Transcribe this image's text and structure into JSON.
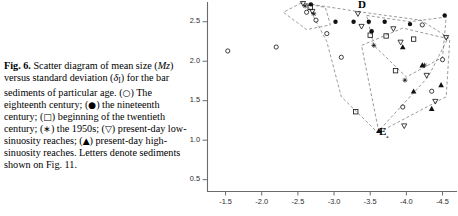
{
  "figure": {
    "label": "Fig. 6.",
    "caption_segments": [
      {
        "t": "Scatter diagram of mean size ("
      },
      {
        "t": "Mz",
        "style": "italic"
      },
      {
        "t": ") versus standard deviation ("
      },
      {
        "t": "δ",
        "style": "italic"
      },
      {
        "t": "I",
        "style": "sub"
      },
      {
        "t": ") for the bar sediments of particular age. ("
      },
      {
        "t": "○",
        "style": "glyph"
      },
      {
        "t": ") The eighteenth century; ("
      },
      {
        "t": "●",
        "style": "glyph"
      },
      {
        "t": ") the nineteenth century; ("
      },
      {
        "t": "□",
        "style": "glyph"
      },
      {
        "t": ") beginning of the twentieth century; ("
      },
      {
        "t": "∗",
        "style": "glyph"
      },
      {
        "t": ") the 1950s; ("
      },
      {
        "t": "▽",
        "style": "glyph"
      },
      {
        "t": ") present-day low-sinuosity reaches; ("
      },
      {
        "t": "▲",
        "style": "glyph"
      },
      {
        "t": ") present-day high-sinuosity reaches. Letters denote sediments shown on Fig. 11."
      }
    ],
    "caption_plain": "Fig. 6. Scatter diagram of mean size (Mz) versus standard deviation (δI) for the bar sediments of particular age. (○) The eighteenth century; (●) the nineteenth century; (□) beginning of the twentieth century; (∗) the 1950s; (▽) present-day low-sinuosity reaches; (▲) present-day high-sinuosity reaches. Letters denote sediments shown on Fig. 11."
  },
  "legend_keys": [
    {
      "symbol": "○",
      "name": "open-circle",
      "label": "The eighteenth century"
    },
    {
      "symbol": "●",
      "name": "filled-circle",
      "label": "the nineteenth century"
    },
    {
      "symbol": "□",
      "name": "open-square",
      "label": "beginning of the twentieth century"
    },
    {
      "symbol": "∗",
      "name": "asterisk",
      "label": "the 1950s"
    },
    {
      "symbol": "▽",
      "name": "open-triangle-down",
      "label": "present-day low-sinuosity reaches"
    },
    {
      "symbol": "▲",
      "name": "filled-triangle-up",
      "label": "present-day high-sinuosity reaches"
    }
  ],
  "chart_data": {
    "type": "scatter",
    "title": "",
    "xlabel": "",
    "ylabel": "",
    "xlim": [
      -1.25,
      -4.7
    ],
    "ylim": [
      0.35,
      2.75
    ],
    "x_reversed": true,
    "grid": false,
    "legend_position": "none",
    "xticks": [
      -1.5,
      -2.0,
      -2.5,
      -3.0,
      -3.5,
      -4.0,
      -4.5
    ],
    "xticklabels": [
      "-1.5",
      "-2.0",
      "-2.5",
      "-3.0",
      "-3.5",
      "-4.0",
      "-4.5"
    ],
    "yticks": [
      0.5,
      1.0,
      1.5,
      2.0,
      2.5
    ],
    "yticklabels": [
      "0.5",
      "1.0",
      "1.5",
      "2.0",
      "2.5"
    ],
    "annotations": [
      {
        "text": "D",
        "x": -3.33,
        "y": 2.72,
        "bold": true
      },
      {
        "text": "E₂",
        "x": -3.62,
        "y": 1.12,
        "bold": true
      }
    ],
    "series": [
      {
        "name": "The eighteenth century",
        "marker": "open-circle",
        "points": [
          {
            "x": -1.53,
            "y": 2.13
          },
          {
            "x": -2.2,
            "y": 2.18
          },
          {
            "x": -2.62,
            "y": 2.62
          },
          {
            "x": -2.75,
            "y": 2.52
          },
          {
            "x": -2.9,
            "y": 2.35
          },
          {
            "x": -3.1,
            "y": 2.05
          },
          {
            "x": -4.22,
            "y": 2.46
          },
          {
            "x": -4.5,
            "y": 2.02
          },
          {
            "x": -4.35,
            "y": 1.62
          },
          {
            "x": -3.95,
            "y": 1.42
          }
        ]
      },
      {
        "name": "the nineteenth century",
        "marker": "filled-circle",
        "points": [
          {
            "x": -2.68,
            "y": 2.72
          },
          {
            "x": -3.02,
            "y": 2.5
          },
          {
            "x": -3.27,
            "y": 2.5
          },
          {
            "x": -3.48,
            "y": 2.5
          },
          {
            "x": -3.7,
            "y": 2.5
          },
          {
            "x": -4.05,
            "y": 2.47
          },
          {
            "x": -4.53,
            "y": 2.58
          },
          {
            "x": -3.52,
            "y": 2.38
          }
        ]
      },
      {
        "name": "beginning of the twentieth century",
        "marker": "open-square",
        "points": [
          {
            "x": -2.67,
            "y": 2.68
          },
          {
            "x": -3.5,
            "y": 2.33
          },
          {
            "x": -3.72,
            "y": 2.32
          },
          {
            "x": -3.85,
            "y": 1.88
          },
          {
            "x": -4.1,
            "y": 2.28
          },
          {
            "x": -3.3,
            "y": 1.36
          }
        ]
      },
      {
        "name": "the 1950s",
        "marker": "asterisk",
        "points": [
          {
            "x": -2.6,
            "y": 2.7
          },
          {
            "x": -2.72,
            "y": 2.6
          },
          {
            "x": -3.55,
            "y": 2.2
          },
          {
            "x": -4.25,
            "y": 1.95
          },
          {
            "x": -3.98,
            "y": 1.76
          }
        ]
      },
      {
        "name": "present-day low-sinuosity reaches",
        "marker": "open-triangle-down",
        "points": [
          {
            "x": -2.57,
            "y": 2.73
          },
          {
            "x": -2.7,
            "y": 2.63
          },
          {
            "x": -3.33,
            "y": 2.6
          },
          {
            "x": -3.38,
            "y": 2.44
          },
          {
            "x": -3.82,
            "y": 2.41
          },
          {
            "x": -3.92,
            "y": 2.24
          },
          {
            "x": -4.28,
            "y": 1.82
          },
          {
            "x": -4.4,
            "y": 1.49
          },
          {
            "x": -3.97,
            "y": 1.18
          },
          {
            "x": -4.55,
            "y": 2.3
          }
        ]
      },
      {
        "name": "present-day high-sinuosity reaches",
        "marker": "filled-triangle-up",
        "points": [
          {
            "x": -3.62,
            "y": 1.12
          },
          {
            "x": -4.22,
            "y": 1.95
          },
          {
            "x": -4.1,
            "y": 1.62
          },
          {
            "x": -4.35,
            "y": 1.4
          },
          {
            "x": -3.95,
            "y": 2.18
          },
          {
            "x": -4.48,
            "y": 1.7
          }
        ]
      }
    ],
    "envelopes": [
      {
        "name": "envelope-upper-left",
        "points": [
          [
            -2.55,
            2.74
          ],
          [
            -2.3,
            2.62
          ],
          [
            -2.62,
            2.4
          ],
          [
            -2.95,
            2.46
          ],
          [
            -2.88,
            2.68
          ]
        ]
      },
      {
        "name": "envelope-main",
        "points": [
          [
            -2.62,
            2.73
          ],
          [
            -3.4,
            2.62
          ],
          [
            -4.2,
            2.52
          ],
          [
            -4.58,
            2.3
          ],
          [
            -4.3,
            1.8
          ],
          [
            -3.6,
            1.1
          ],
          [
            -3.1,
            1.55
          ],
          [
            -2.9,
            2.25
          ]
        ]
      },
      {
        "name": "envelope-right",
        "points": [
          [
            -3.45,
            2.58
          ],
          [
            -4.05,
            2.5
          ],
          [
            -4.55,
            2.56
          ],
          [
            -4.5,
            2.05
          ],
          [
            -4.0,
            1.8
          ],
          [
            -3.55,
            2.2
          ]
        ]
      },
      {
        "name": "envelope-lower",
        "points": [
          [
            -3.62,
            1.1
          ],
          [
            -4.55,
            1.55
          ],
          [
            -4.6,
            2.28
          ],
          [
            -3.95,
            2.42
          ],
          [
            -3.38,
            2.2
          ]
        ]
      }
    ]
  }
}
